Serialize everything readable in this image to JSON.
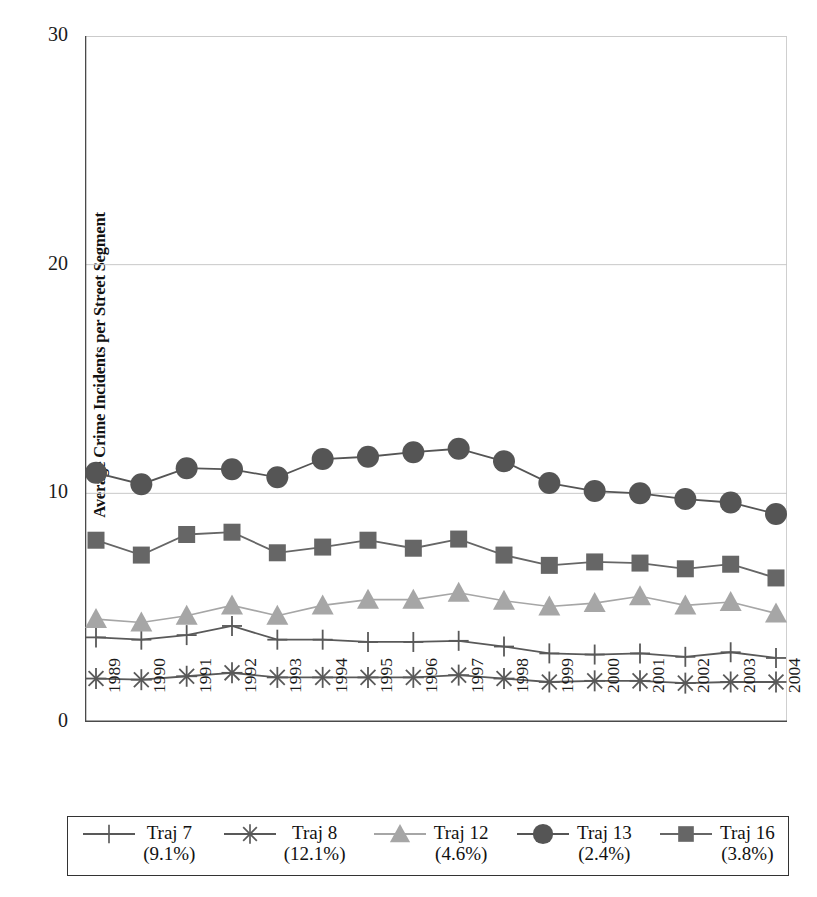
{
  "chart_data": {
    "type": "line",
    "title": "",
    "xlabel": "",
    "ylabel": "Average Crime Incidents per Street Segment",
    "ylim": [
      0,
      30
    ],
    "yticks": [
      0,
      10,
      20,
      30
    ],
    "ytick_labels": [
      "0",
      "10",
      "20",
      "30"
    ],
    "grid": "horizontal",
    "legend_position": "bottom",
    "categories": [
      "1989",
      "1990",
      "1991",
      "1992",
      "1993",
      "1994",
      "1995",
      "1996",
      "1997",
      "1998",
      "1999",
      "2000",
      "2001",
      "2002",
      "2003",
      "2004"
    ],
    "series": [
      {
        "name": "Traj 7",
        "percent": "(9.1%)",
        "marker": "plus",
        "color": "#595959",
        "values": [
          3.7,
          3.6,
          3.8,
          4.2,
          3.6,
          3.6,
          3.5,
          3.5,
          3.55,
          3.3,
          3.0,
          2.95,
          3.0,
          2.85,
          3.05,
          2.8
        ]
      },
      {
        "name": "Traj 8",
        "percent": "(12.1%)",
        "marker": "asterisk",
        "color": "#595959",
        "values": [
          1.9,
          1.85,
          2.0,
          2.15,
          1.95,
          1.95,
          1.95,
          1.95,
          2.05,
          1.9,
          1.75,
          1.8,
          1.8,
          1.7,
          1.75,
          1.75
        ]
      },
      {
        "name": "Traj 12",
        "percent": "(4.6%)",
        "marker": "triangle",
        "color": "#a6a6a6",
        "values": [
          4.5,
          4.35,
          4.65,
          5.1,
          4.65,
          5.1,
          5.35,
          5.35,
          5.65,
          5.3,
          5.05,
          5.2,
          5.5,
          5.1,
          5.25,
          4.75
        ]
      },
      {
        "name": "Traj 13",
        "percent": "(2.4%)",
        "marker": "circle",
        "color": "#555555",
        "values": [
          10.9,
          10.4,
          11.1,
          11.05,
          10.7,
          11.5,
          11.6,
          11.8,
          11.95,
          11.4,
          10.45,
          10.1,
          10.0,
          9.75,
          9.6,
          9.1
        ]
      },
      {
        "name": "Traj 16",
        "percent": "(3.8%)",
        "marker": "square",
        "color": "#666666",
        "values": [
          7.95,
          7.3,
          8.2,
          8.3,
          7.4,
          7.65,
          7.95,
          7.6,
          8.0,
          7.3,
          6.85,
          7.0,
          6.95,
          6.7,
          6.9,
          6.3
        ]
      }
    ]
  },
  "axes": {
    "y_title": "Average Crime Incidents per Street Segment"
  }
}
